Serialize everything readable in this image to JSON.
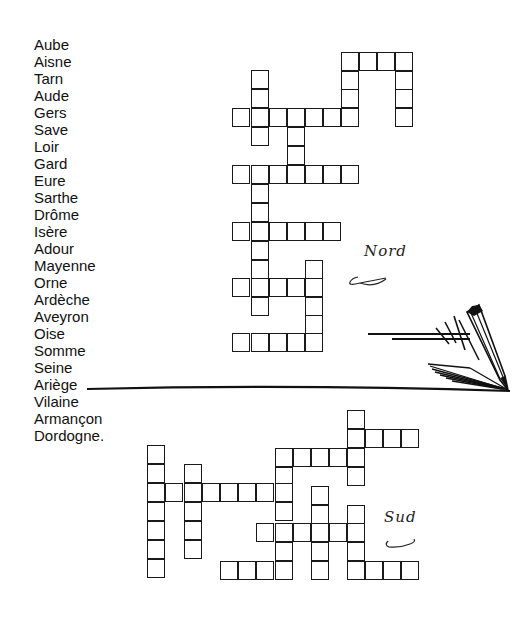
{
  "word_list": [
    "Aube",
    "Aisne",
    "Tarn",
    "Aude",
    "Gers",
    "Save",
    "Loir",
    "Gard",
    "Eure",
    "Sarthe",
    "Drôme",
    "Isère",
    "Adour",
    "Mayenne",
    "Orne",
    "Ardèche",
    "Aveyron",
    "Oise",
    "Somme",
    "Seine",
    "Ariège",
    "Vilaine",
    "Armançon",
    "Dordogne."
  ],
  "labels": {
    "north": "Nord",
    "south": "Sud"
  },
  "grid_north": {
    "cells": [
      [
        342,
        53
      ],
      [
        360,
        53
      ],
      [
        378,
        53
      ],
      [
        396,
        53
      ],
      [
        342,
        72
      ],
      [
        396,
        72
      ],
      [
        342,
        90
      ],
      [
        396,
        90
      ],
      [
        396,
        109
      ],
      [
        252,
        71
      ],
      [
        252,
        90
      ],
      [
        233,
        109
      ],
      [
        252,
        109
      ],
      [
        270,
        109
      ],
      [
        288,
        109
      ],
      [
        306,
        109
      ],
      [
        324,
        109
      ],
      [
        342,
        109
      ],
      [
        252,
        128
      ],
      [
        288,
        128
      ],
      [
        288,
        147
      ],
      [
        233,
        166
      ],
      [
        252,
        166
      ],
      [
        270,
        166
      ],
      [
        288,
        166
      ],
      [
        306,
        166
      ],
      [
        324,
        166
      ],
      [
        342,
        166
      ],
      [
        252,
        185
      ],
      [
        252,
        204
      ],
      [
        233,
        223
      ],
      [
        252,
        223
      ],
      [
        270,
        223
      ],
      [
        288,
        223
      ],
      [
        306,
        223
      ],
      [
        324,
        223
      ],
      [
        252,
        242
      ],
      [
        252,
        261
      ],
      [
        306,
        261
      ],
      [
        233,
        279
      ],
      [
        252,
        279
      ],
      [
        270,
        279
      ],
      [
        288,
        279
      ],
      [
        306,
        279
      ],
      [
        252,
        298
      ],
      [
        306,
        298
      ],
      [
        306,
        316
      ],
      [
        233,
        334
      ],
      [
        252,
        334
      ],
      [
        270,
        334
      ],
      [
        288,
        334
      ],
      [
        306,
        334
      ]
    ]
  },
  "grid_south": {
    "cells": [
      [
        348,
        411
      ],
      [
        348,
        430
      ],
      [
        366,
        430
      ],
      [
        384,
        430
      ],
      [
        402,
        430
      ],
      [
        276,
        449
      ],
      [
        294,
        449
      ],
      [
        312,
        449
      ],
      [
        330,
        449
      ],
      [
        348,
        449
      ],
      [
        276,
        468
      ],
      [
        348,
        468
      ],
      [
        148,
        446
      ],
      [
        148,
        465
      ],
      [
        185,
        465
      ],
      [
        148,
        484
      ],
      [
        166,
        484
      ],
      [
        185,
        484
      ],
      [
        203,
        484
      ],
      [
        221,
        484
      ],
      [
        239,
        484
      ],
      [
        257,
        484
      ],
      [
        276,
        484
      ],
      [
        148,
        503
      ],
      [
        185,
        503
      ],
      [
        276,
        503
      ],
      [
        312,
        487
      ],
      [
        312,
        506
      ],
      [
        348,
        506
      ],
      [
        148,
        522
      ],
      [
        185,
        522
      ],
      [
        257,
        524
      ],
      [
        276,
        524
      ],
      [
        294,
        524
      ],
      [
        312,
        524
      ],
      [
        330,
        524
      ],
      [
        348,
        524
      ],
      [
        148,
        541
      ],
      [
        185,
        541
      ],
      [
        276,
        543
      ],
      [
        312,
        543
      ],
      [
        348,
        543
      ],
      [
        148,
        560
      ],
      [
        221,
        562
      ],
      [
        239,
        562
      ],
      [
        257,
        562
      ],
      [
        276,
        562
      ],
      [
        312,
        562
      ],
      [
        348,
        562
      ],
      [
        366,
        562
      ],
      [
        384,
        562
      ],
      [
        402,
        562
      ]
    ]
  }
}
